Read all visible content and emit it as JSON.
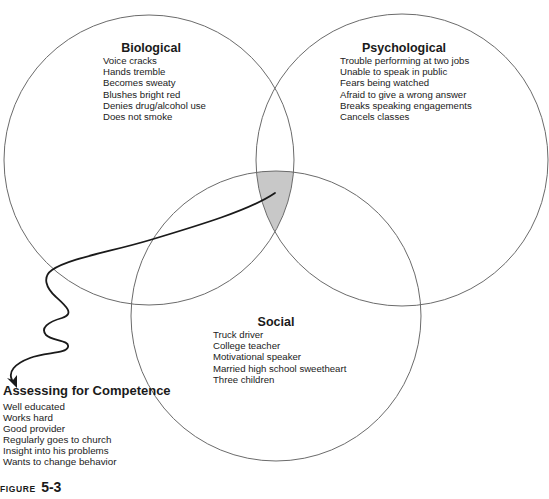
{
  "diagram": {
    "type": "venn-diagram",
    "colors": {
      "circle_stroke": "#6b6b6b",
      "intersection_fill": "#c8c8c8",
      "arrow_stroke": "#1a1a1a",
      "background": "#ffffff"
    },
    "circles": [
      {
        "id": "biological",
        "title": "Biological",
        "items": [
          "Voice cracks",
          "Hands tremble",
          "Becomes sweaty",
          "Blushes bright red",
          "Denies drug/alcohol use",
          "Does not smoke"
        ]
      },
      {
        "id": "psychological",
        "title": "Psychological",
        "items": [
          "Trouble performing at two jobs",
          "Unable to speak in public",
          "Fears being watched",
          "Afraid to give a wrong answer",
          "Breaks speaking engagements",
          "Cancels classes"
        ]
      },
      {
        "id": "social",
        "title": "Social",
        "items": [
          "Truck driver",
          "College teacher",
          "Motivational speaker",
          "Married high school sweetheart",
          "Three children"
        ]
      }
    ],
    "callout": {
      "title": "Assessing for Competence",
      "items": [
        "Well educated",
        "Works hard",
        "Good provider",
        "Regularly goes to church",
        "Insight into his problems",
        "Wants to change behavior"
      ]
    },
    "figure": {
      "label": "FIGURE",
      "number": "5-3"
    }
  }
}
